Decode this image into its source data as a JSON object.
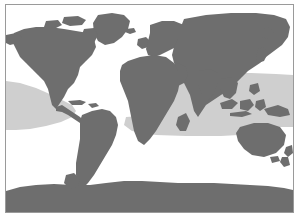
{
  "figure": {
    "type": "thematic-world-map",
    "caption": "",
    "projection": "equirectangular",
    "frame": {
      "border_color": "#9a9a9a",
      "border_width_px": 1,
      "background_color": "#ffffff"
    }
  },
  "colors": {
    "land": "#6e6e6e",
    "ocean": "#ffffff",
    "range_band": "#cfcfcf",
    "border": "#9a9a9a",
    "page_background": "#ffffff"
  },
  "legend": {
    "visible": false,
    "entries": [
      {
        "label": "Land",
        "color": "#6e6e6e"
      },
      {
        "label": "Distribution range",
        "color": "#cfcfcf"
      },
      {
        "label": "Ocean",
        "color": "#ffffff"
      }
    ]
  },
  "map_layers": [
    {
      "name": "ocean",
      "color": "#ffffff",
      "order": 0
    },
    {
      "name": "range-band",
      "color": "#cfcfcf",
      "order": 1
    },
    {
      "name": "landmasses",
      "color": "#6e6e6e",
      "order": 2
    }
  ],
  "landmasses": [
    "North America",
    "Greenland",
    "South America",
    "Europe",
    "Africa",
    "Asia",
    "Australia",
    "Antarctica",
    "Indonesia",
    "Japan",
    "New Zealand",
    "Madagascar",
    "British Isles",
    "Caribbean islands"
  ],
  "annotations": {
    "axis_labels": [],
    "tick_labels": [],
    "text_on_map": []
  }
}
